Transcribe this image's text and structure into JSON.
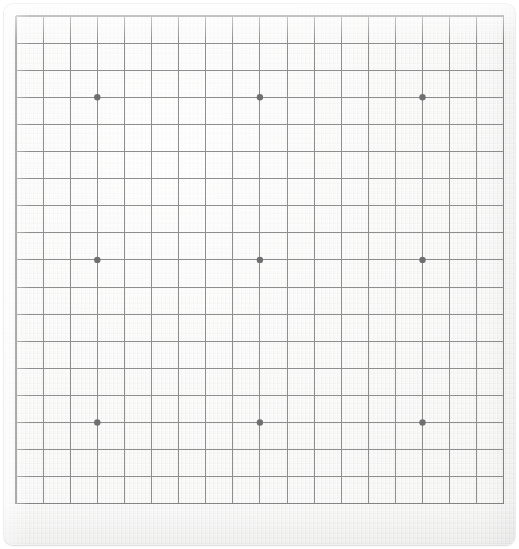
{
  "app": {
    "title": "Go Board",
    "canvas_width": 519,
    "canvas_height": 549
  },
  "board": {
    "name": "goban",
    "size": 19,
    "size_label": "19x19",
    "ruleset_label": "Go",
    "surface_color": "#f2f2f1",
    "line_color": "#8e8e8e",
    "edge_line_color": "#848484",
    "star_point_color": "#6f6f6f",
    "background_color": "#ffffff",
    "corner_radius": 9,
    "coordinates_visible": false,
    "grid": {
      "origin_x": 12,
      "origin_y": 12,
      "cell_size": 27.1,
      "line_count": 19,
      "first_line_px": 12,
      "last_line_px": 500
    },
    "star_points": [
      {
        "col": 4,
        "row": 4,
        "label": "D16"
      },
      {
        "col": 10,
        "row": 4,
        "label": "K16"
      },
      {
        "col": 16,
        "row": 4,
        "label": "Q16"
      },
      {
        "col": 4,
        "row": 10,
        "label": "D10"
      },
      {
        "col": 10,
        "row": 10,
        "label": "K10"
      },
      {
        "col": 16,
        "row": 10,
        "label": "Q10"
      },
      {
        "col": 4,
        "row": 16,
        "label": "D4"
      },
      {
        "col": 10,
        "row": 16,
        "label": "K4"
      },
      {
        "col": 16,
        "row": 16,
        "label": "Q4"
      }
    ],
    "star_point_radius": 3.2,
    "stones": [],
    "column_labels": [
      "A",
      "B",
      "C",
      "D",
      "E",
      "F",
      "G",
      "H",
      "J",
      "K",
      "L",
      "M",
      "N",
      "O",
      "P",
      "Q",
      "R",
      "S",
      "T"
    ],
    "row_labels": [
      "19",
      "18",
      "17",
      "16",
      "15",
      "14",
      "13",
      "12",
      "11",
      "10",
      "9",
      "8",
      "7",
      "6",
      "5",
      "4",
      "3",
      "2",
      "1"
    ]
  }
}
